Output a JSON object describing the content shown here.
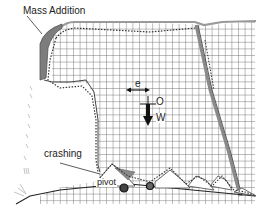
{
  "figure": {
    "type": "mesh-deformation-diagram",
    "labels": {
      "mass_addition": "Mass Addition",
      "eccentricity": "e",
      "origin": "O",
      "weight": "W",
      "crashing": "crashing",
      "pivot": "pivot"
    },
    "colors": {
      "grid": "#7a7a7a",
      "outline": "#555555",
      "mass_fill": "#8a8a8a",
      "dotted": "#333333",
      "arrow": "#1a1a1a",
      "text": "#222222"
    }
  }
}
